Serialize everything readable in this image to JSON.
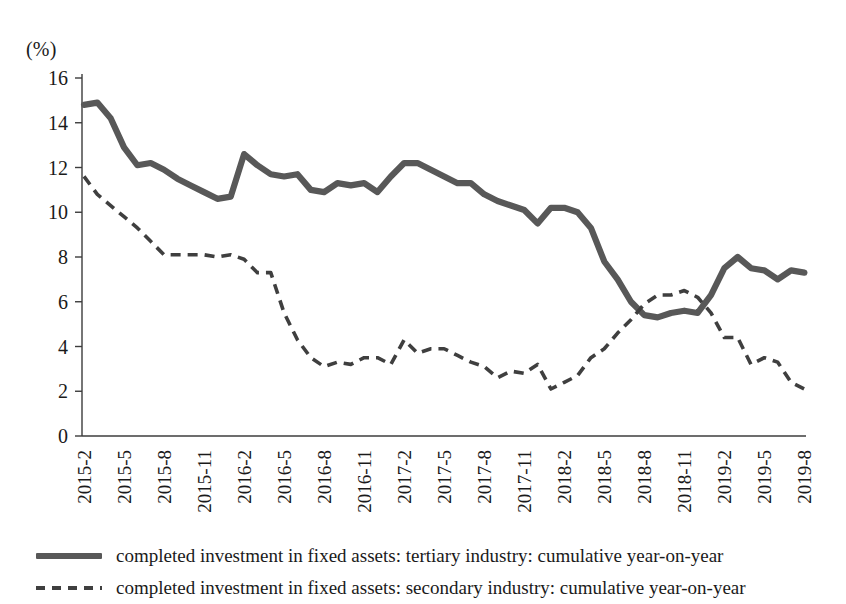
{
  "chart_data": {
    "type": "line",
    "title": "",
    "xlabel": "",
    "ylabel": "(%)",
    "ylim": [
      0,
      16
    ],
    "ytick_step": 2,
    "yticks": [
      "0",
      "2",
      "4",
      "6",
      "8",
      "10",
      "12",
      "14",
      "16"
    ],
    "grid": false,
    "legend_position": "bottom-left",
    "x": [
      "2015-2",
      "2015-3",
      "2015-4",
      "2015-5",
      "2015-6",
      "2015-7",
      "2015-8",
      "2015-9",
      "2015-10",
      "2015-11",
      "2015-12",
      "2016-1",
      "2016-2",
      "2016-3",
      "2016-4",
      "2016-5",
      "2016-6",
      "2016-7",
      "2016-8",
      "2016-9",
      "2016-10",
      "2016-11",
      "2016-12",
      "2017-1",
      "2017-2",
      "2017-3",
      "2017-4",
      "2017-5",
      "2017-6",
      "2017-7",
      "2017-8",
      "2017-9",
      "2017-10",
      "2017-11",
      "2017-12",
      "2018-1",
      "2018-2",
      "2018-3",
      "2018-4",
      "2018-5",
      "2018-6",
      "2018-7",
      "2018-8",
      "2018-9",
      "2018-10",
      "2018-11",
      "2018-12",
      "2019-1",
      "2019-2",
      "2019-3",
      "2019-4",
      "2019-5",
      "2019-6",
      "2019-7",
      "2019-8"
    ],
    "xtick_labels": [
      "2015-2",
      "2015-5",
      "2015-8",
      "2015-11",
      "2016-2",
      "2016-5",
      "2016-8",
      "2016-11",
      "2017-2",
      "2017-5",
      "2017-8",
      "2017-11",
      "2018-2",
      "2018-5",
      "2018-8",
      "2018-11",
      "2019-2",
      "2019-5",
      "2019-8"
    ],
    "xtick_indices": [
      0,
      3,
      6,
      9,
      12,
      15,
      18,
      21,
      24,
      27,
      30,
      33,
      36,
      39,
      42,
      45,
      48,
      51,
      54
    ],
    "series": [
      {
        "name": "completed investment in fixed assets: tertiary industry: cumulative year-on-year",
        "style": "solid",
        "color": "#585858",
        "values": [
          14.8,
          14.9,
          14.2,
          12.9,
          12.1,
          12.2,
          11.9,
          11.5,
          11.2,
          10.9,
          10.6,
          10.7,
          12.6,
          12.1,
          11.7,
          11.6,
          11.7,
          11.0,
          10.9,
          11.3,
          11.2,
          11.3,
          10.9,
          11.6,
          12.2,
          12.2,
          11.9,
          11.6,
          11.3,
          11.3,
          10.8,
          10.5,
          10.3,
          10.1,
          9.5,
          10.2,
          10.2,
          10.0,
          9.3,
          7.8,
          7.0,
          6.0,
          5.4,
          5.3,
          5.5,
          5.6,
          5.5,
          6.3,
          7.5,
          8.0,
          7.5,
          7.4,
          7.0,
          7.4,
          7.3
        ]
      },
      {
        "name": "completed investment in fixed assets: secondary industry: cumulative year-on-year",
        "style": "dashed",
        "color": "#3f3f3f",
        "values": [
          11.6,
          10.8,
          10.3,
          9.8,
          9.3,
          8.7,
          8.1,
          8.1,
          8.1,
          8.1,
          8.0,
          8.1,
          7.9,
          7.3,
          7.3,
          5.5,
          4.3,
          3.5,
          3.1,
          3.3,
          3.2,
          3.5,
          3.5,
          3.2,
          4.3,
          3.7,
          3.9,
          3.9,
          3.6,
          3.3,
          3.1,
          2.6,
          2.9,
          2.8,
          3.2,
          2.1,
          2.4,
          2.7,
          3.5,
          3.9,
          4.6,
          5.2,
          5.9,
          6.3,
          6.3,
          6.5,
          6.2,
          5.5,
          4.4,
          4.4,
          3.2,
          3.5,
          3.3,
          2.4,
          2.1
        ]
      }
    ]
  },
  "legend": {
    "tertiary_label": "completed investment in fixed assets: tertiary industry: cumulative year-on-year",
    "secondary_label": "completed investment in fixed assets: secondary industry: cumulative year-on-year"
  }
}
